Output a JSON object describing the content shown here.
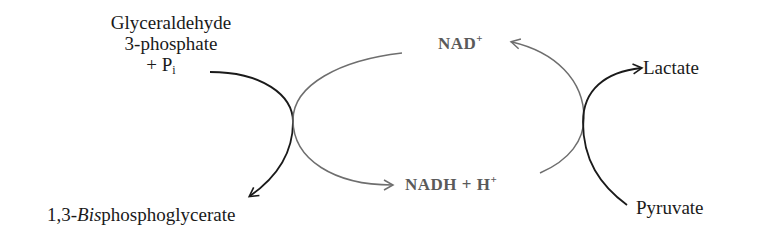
{
  "diagram": {
    "substrate_left": {
      "line1": "Glyceraldehyde",
      "line2": "3-phosphate",
      "line3_prefix": "+ P",
      "line3_sub": "i"
    },
    "product_left": {
      "prefix": "1,3-",
      "italic": "Bis",
      "suffix": "phosphoglycerate"
    },
    "cofactor_top": {
      "base": "NAD",
      "sup": "+"
    },
    "cofactor_bottom": {
      "base": "NADH + H",
      "sup": "+"
    },
    "product_right": "Lactate",
    "substrate_right": "Pyruvate",
    "colors": {
      "main_arrow": "#1a1a1a",
      "cofactor_arrow": "#6e6e6e",
      "cofactor_text": "#5a5a5a"
    }
  }
}
